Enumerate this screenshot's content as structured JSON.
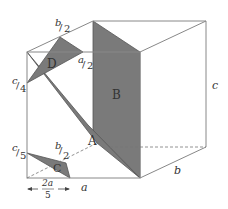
{
  "diagram": {
    "type": "box-with-cross-sections",
    "colors": {
      "edge": "#888888",
      "fill": "#7a7a7a",
      "fill_stroke": "#555555",
      "dash": "#777777",
      "text": "#333333"
    },
    "vertices": {
      "ftl": [
        27,
        52
      ],
      "ftr": [
        140,
        52
      ],
      "fbl": [
        27,
        178
      ],
      "fbr": [
        140,
        178
      ],
      "btl": [
        93,
        21
      ],
      "btr": [
        206,
        21
      ],
      "bbr": [
        206,
        147
      ]
    },
    "shapes": [
      {
        "id": "D",
        "label": "D",
        "points": "60,37 83,52 27,83",
        "label_pos": [
          48,
          68
        ]
      },
      {
        "id": "B",
        "label": "B",
        "points": "93,21 140,52 140,178 93,132",
        "label_pos": [
          113,
          98
        ]
      },
      {
        "id": "A",
        "label": "A",
        "points": "27,52 97,143 140,178 93,132",
        "label_pos": [
          93,
          141
        ]
      },
      {
        "id": "C",
        "label": "C",
        "points": "27,153 70,178 66,163",
        "label_pos": [
          55,
          170
        ]
      }
    ],
    "edge_labels": {
      "top_b_half": {
        "num": "b",
        "den": "2"
      },
      "top_a_half": {
        "num": "a",
        "den": "2"
      },
      "left_c_quarter": {
        "num": "c",
        "den": "4"
      },
      "left_c_fifth": {
        "num": "c",
        "den": "5"
      },
      "base_b_half": {
        "num": "b",
        "den": "2"
      },
      "c": "c",
      "a": "a",
      "b": "b",
      "two_a_fifths_num": "2a",
      "two_a_fifths_den": "5"
    }
  }
}
